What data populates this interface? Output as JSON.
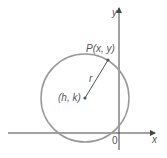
{
  "diagram": {
    "colors": {
      "axis": "#444444",
      "circle": "#999999",
      "radius": "#555555",
      "text": "#555555"
    },
    "labels": {
      "y_axis": "y",
      "x_axis": "x",
      "origin": "0",
      "point": "P(x, y)",
      "center": "(h, k)",
      "radius": "r"
    },
    "geometry": {
      "center": [
        85,
        98
      ],
      "radius": 44,
      "point": [
        108,
        60
      ],
      "x_axis_y": 133,
      "y_axis_x": 119
    }
  }
}
